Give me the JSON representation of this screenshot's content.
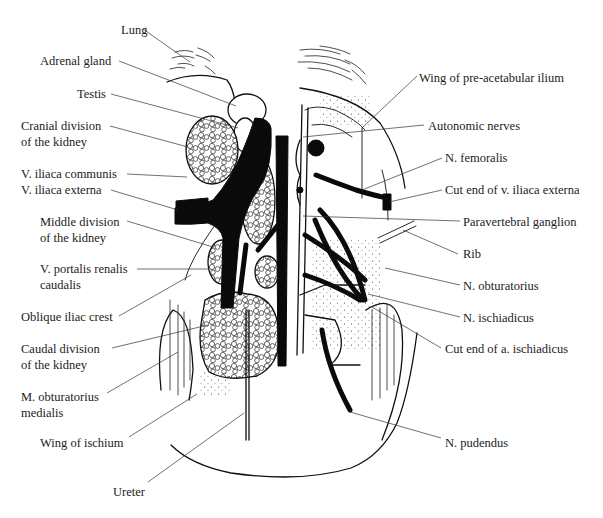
{
  "figure": {
    "labels_left": [
      {
        "id": "lung",
        "lines": [
          "Lung"
        ],
        "x": 121,
        "y": 34,
        "anchor": "start",
        "leader": [
          [
            143,
            29
          ],
          [
            190,
            62
          ]
        ]
      },
      {
        "id": "adrenal-gland",
        "lines": [
          "Adrenal gland"
        ],
        "x": 40,
        "y": 65,
        "anchor": "start",
        "leader": [
          [
            119,
            61
          ],
          [
            236,
            106
          ]
        ]
      },
      {
        "id": "testis",
        "lines": [
          "Testis"
        ],
        "x": 77,
        "y": 98,
        "anchor": "start",
        "leader": [
          [
            111,
            94
          ],
          [
            238,
            128
          ]
        ]
      },
      {
        "id": "cranial-division-kidney",
        "lines": [
          "Cranial division",
          "of the kidney"
        ],
        "x": 21,
        "y": 130,
        "anchor": "start",
        "leader": [
          [
            110,
            126
          ],
          [
            188,
            147
          ]
        ]
      },
      {
        "id": "v-iliaca-communis",
        "lines": [
          "V. iliaca communis"
        ],
        "x": 21,
        "y": 178,
        "anchor": "start",
        "leader": [
          [
            127,
            174
          ],
          [
            187,
            177
          ]
        ]
      },
      {
        "id": "v-iliaca-externa",
        "lines": [
          "V. iliaca externa"
        ],
        "x": 21,
        "y": 194,
        "anchor": "start",
        "leader": [
          [
            111,
            190
          ],
          [
            178,
            210
          ]
        ]
      },
      {
        "id": "middle-division-kidney",
        "lines": [
          "Middle division",
          "of the kidney"
        ],
        "x": 40,
        "y": 226,
        "anchor": "start",
        "leader": [
          [
            127,
            221
          ],
          [
            213,
            247
          ]
        ]
      },
      {
        "id": "v-portalis-renalis-caudalis",
        "lines": [
          "V. portalis renalis",
          "caudalis"
        ],
        "x": 40,
        "y": 273,
        "anchor": "start",
        "leader": [
          [
            137,
            269
          ],
          [
            209,
            269
          ]
        ]
      },
      {
        "id": "oblique-iliac-crest",
        "lines": [
          "Oblique iliac crest"
        ],
        "x": 21,
        "y": 321,
        "anchor": "start",
        "leader": [
          [
            119,
            316
          ],
          [
            191,
            275
          ]
        ]
      },
      {
        "id": "caudal-division-kidney",
        "lines": [
          "Caudal division",
          "of the kidney"
        ],
        "x": 21,
        "y": 353,
        "anchor": "start",
        "leader": [
          [
            112,
            348
          ],
          [
            208,
            325
          ]
        ]
      },
      {
        "id": "m-obturatorius-medialis",
        "lines": [
          "M. obturatorius",
          "medialis"
        ],
        "x": 21,
        "y": 401,
        "anchor": "start",
        "leader": [
          [
            107,
            393
          ],
          [
            178,
            352
          ]
        ]
      },
      {
        "id": "wing-of-ischium",
        "lines": [
          "Wing of ischium"
        ],
        "x": 40,
        "y": 447,
        "anchor": "start",
        "leader": [
          [
            129,
            437
          ],
          [
            197,
            394
          ]
        ]
      },
      {
        "id": "ureter",
        "lines": [
          "Ureter"
        ],
        "x": 113,
        "y": 496,
        "anchor": "start",
        "leader": [
          [
            148,
            482
          ],
          [
            244,
            413
          ]
        ]
      }
    ],
    "labels_right": [
      {
        "id": "wing-pre-acetabular-ilium",
        "lines": [
          "Wing of pre-acetabular ilium"
        ],
        "x": 419,
        "y": 82,
        "anchor": "start",
        "leader": [
          [
            417,
            76
          ],
          [
            363,
            127
          ]
        ]
      },
      {
        "id": "autonomic-nerves",
        "lines": [
          "Autonomic nerves"
        ],
        "x": 428,
        "y": 130,
        "anchor": "start",
        "leader": [
          [
            424,
            125
          ],
          [
            303,
            137
          ]
        ]
      },
      {
        "id": "n-femoralis",
        "lines": [
          "N. femoralis"
        ],
        "x": 445,
        "y": 162,
        "anchor": "start",
        "leader": [
          [
            442,
            158
          ],
          [
            362,
            190
          ]
        ]
      },
      {
        "id": "cut-end-v-iliaca-externa",
        "lines": [
          "Cut end of v. iliaca externa"
        ],
        "x": 445,
        "y": 194,
        "anchor": "start",
        "leader": [
          [
            442,
            190
          ],
          [
            389,
            202
          ]
        ]
      },
      {
        "id": "paravertebral-ganglion",
        "lines": [
          "Paravertebral ganglion"
        ],
        "x": 463,
        "y": 226,
        "anchor": "start",
        "leader": [
          [
            460,
            221
          ],
          [
            303,
            216
          ]
        ]
      },
      {
        "id": "rib",
        "lines": [
          "Rib"
        ],
        "x": 463,
        "y": 258,
        "anchor": "start",
        "leader": [
          [
            458,
            254
          ],
          [
            403,
            230
          ]
        ]
      },
      {
        "id": "n-obturatorius",
        "lines": [
          "N. obturatorius"
        ],
        "x": 463,
        "y": 290,
        "anchor": "start",
        "leader": [
          [
            460,
            285
          ],
          [
            385,
            268
          ]
        ]
      },
      {
        "id": "n-ischiadicus",
        "lines": [
          "N. ischiadicus"
        ],
        "x": 463,
        "y": 322,
        "anchor": "start",
        "leader": [
          [
            460,
            317
          ],
          [
            368,
            294
          ]
        ]
      },
      {
        "id": "cut-end-a-ischiadicus",
        "lines": [
          "Cut end of a. ischiadicus"
        ],
        "x": 445,
        "y": 353,
        "anchor": "start",
        "leader": [
          [
            441,
            348
          ],
          [
            372,
            307
          ]
        ]
      },
      {
        "id": "n-pudendus",
        "lines": [
          "N. pudendus"
        ],
        "x": 445,
        "y": 447,
        "anchor": "start",
        "leader": [
          [
            441,
            438
          ],
          [
            350,
            412
          ]
        ]
      }
    ],
    "colors": {
      "ink": "#111111",
      "label_text": "#222222",
      "leader": "#333333",
      "background": "#ffffff"
    }
  }
}
